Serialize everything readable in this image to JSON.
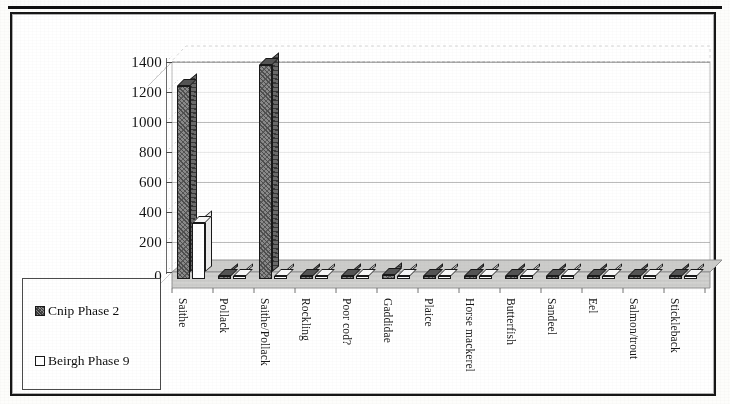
{
  "figure": {
    "kind": "3d-column-chart",
    "border_color": "#1b1b1b",
    "background": "#ffffff"
  },
  "legend": {
    "position": "bottom-left",
    "entries": [
      {
        "label": "Cnip Phase 2",
        "swatch": "hatched-dark-square",
        "color": "#8a8a8a"
      },
      {
        "label": "Beirgh Phase 9",
        "swatch": "open-white-square",
        "color": "#ffffff"
      }
    ]
  },
  "axes": {
    "y_ticks": [
      "0",
      "200",
      "400",
      "600",
      "800",
      "1000",
      "1200",
      "1400"
    ],
    "y_title": "",
    "x_title": ""
  },
  "chart_data": {
    "type": "bar",
    "title": "",
    "subtitle": "",
    "xlabel": "",
    "ylabel": "",
    "ylim": [
      0,
      1400
    ],
    "yticks": [
      0,
      200,
      400,
      600,
      800,
      1000,
      1200,
      1400
    ],
    "grid": true,
    "legend_position": "bottom-left",
    "three_d": true,
    "categories": [
      "Saithe",
      "Pollack",
      "Saithe/Pollack",
      "Rockling",
      "Poor cod?",
      "Gaddidae",
      "Plaice",
      "Horse mackerel",
      "Butterfish",
      "Sandeel",
      "Eel",
      "Salmon/trout",
      "Stickleback"
    ],
    "series": [
      {
        "name": "Cnip Phase 2",
        "color": "#8a8a8a",
        "values": [
          1285,
          12,
          1425,
          8,
          14,
          30,
          0,
          0,
          9,
          8,
          13,
          0,
          17
        ]
      },
      {
        "name": "Beirgh Phase 9",
        "color": "#ffffff",
        "values": [
          372,
          0,
          0,
          0,
          0,
          0,
          7,
          6,
          0,
          0,
          9,
          8,
          10
        ]
      }
    ]
  }
}
